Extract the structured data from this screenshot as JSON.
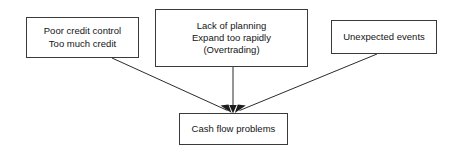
{
  "diagram": {
    "type": "flowchart",
    "background_color": "#ffffff",
    "box_border_color": "#3a3a3a",
    "text_color": "#141414",
    "edge_color": "#2b2b2b",
    "nodes": [
      {
        "id": "poor-credit",
        "lines": [
          "Poor credit control",
          "Too much credit"
        ]
      },
      {
        "id": "lack-planning",
        "lines": [
          "Lack of planning",
          "Expand too rapidly",
          "(Overtrading)"
        ]
      },
      {
        "id": "unexpected-events",
        "lines": [
          "Unexpected events"
        ]
      },
      {
        "id": "cash-flow",
        "lines": [
          "Cash flow problems"
        ]
      }
    ],
    "edges": [
      {
        "id": "poor-credit-to-cash-flow",
        "from": "poor-credit",
        "to": "cash-flow",
        "arrowhead": "filled-triangle"
      },
      {
        "id": "lack-planning-to-cash-flow",
        "from": "lack-planning",
        "to": "cash-flow",
        "arrowhead": "filled-triangle"
      },
      {
        "id": "unexpected-events-to-cash-flow",
        "from": "unexpected-events",
        "to": "cash-flow",
        "arrowhead": "filled-triangle"
      }
    ]
  }
}
